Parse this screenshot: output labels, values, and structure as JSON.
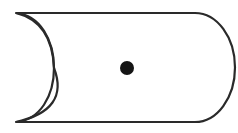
{
  "diagram": {
    "shape": "cylinder-side-view",
    "colors": {
      "stroke": "#2a2a2a",
      "fill": "#ffffff",
      "dot": "#151515",
      "background": "#ffffff"
    },
    "center_dot": {
      "cx": 127,
      "cy": 68,
      "r": 7
    }
  }
}
